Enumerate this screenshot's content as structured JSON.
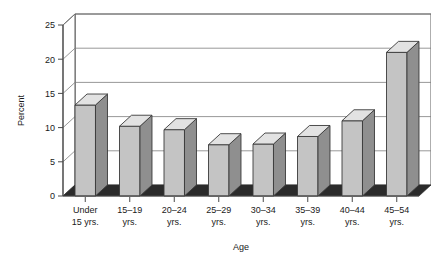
{
  "chart_data": {
    "type": "bar",
    "title": "",
    "xlabel": "Age",
    "ylabel": "Percent",
    "categories": [
      "Under 15 yrs.",
      "15–19 yrs.",
      "20–24 yrs.",
      "25–29 yrs.",
      "30–34 yrs.",
      "35–39 yrs.",
      "40–44 yrs.",
      "45–54 yrs."
    ],
    "category_lines": [
      [
        "Under",
        "15 yrs."
      ],
      [
        "15–19",
        "yrs."
      ],
      [
        "20–24",
        "yrs."
      ],
      [
        "25–29",
        "yrs."
      ],
      [
        "30–34",
        "yrs."
      ],
      [
        "35–39",
        "yrs."
      ],
      [
        "40–44",
        "yrs."
      ],
      [
        "45–54",
        "yrs."
      ]
    ],
    "values": [
      13.3,
      10.2,
      9.7,
      7.5,
      7.6,
      8.7,
      11.0,
      21.0
    ],
    "ylim": [
      0,
      25
    ],
    "yticks": [
      0,
      5,
      10,
      15,
      20,
      25
    ],
    "ytick_labels": [
      "0",
      "5",
      "10",
      "15",
      "20",
      "25"
    ],
    "grid": true,
    "legend": false,
    "style": "3d-column",
    "colors": {
      "bar_front": "#c4c4c4",
      "bar_side": "#8f8f8f",
      "bar_top": "#e2e2e2",
      "bar_outline": "#3a3a3a",
      "floor": "#2b2b2b",
      "wall": "#ffffff",
      "gridline": "#7d7d7d",
      "axis": "#4a4a4a",
      "text": "#1a1a1a",
      "background": "#ffffff"
    }
  }
}
